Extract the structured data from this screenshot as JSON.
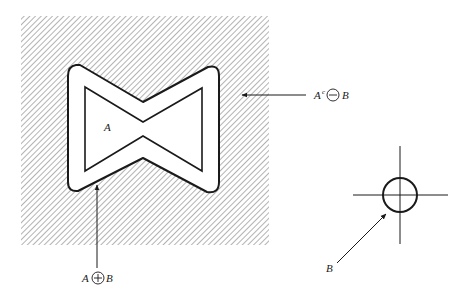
{
  "figure": {
    "colors": {
      "ink": "#1a1a1a",
      "hatch": "#8a8a8a",
      "background": "#ffffff"
    },
    "labels": {
      "set_a": "A",
      "dilation": {
        "left": "A",
        "operator": "+",
        "right": "B"
      },
      "complement_erosion": {
        "left": "A",
        "superscript": "c",
        "operator": "−",
        "right": "B"
      },
      "structuring_element": "B"
    }
  }
}
